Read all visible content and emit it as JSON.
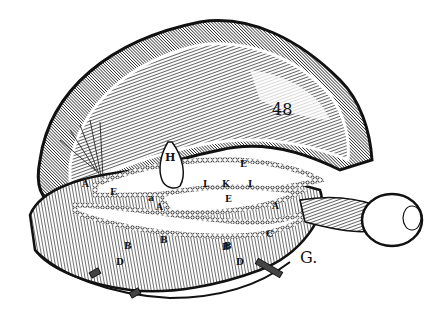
{
  "illustration": {
    "subject": "Anatomical woodcut of brain dissection with eye and optic nerve",
    "colors": {
      "ink": "#111111",
      "paper": "#ffffff"
    },
    "plate_number": "48",
    "figure_letter": "G.",
    "labels": {
      "H": "H",
      "E_left": "E",
      "E_center": "E",
      "E_right": "E",
      "L": "L",
      "K": "K",
      "I": "I",
      "A_left": "A",
      "A_center": "A",
      "A_right": "A",
      "B1": "B",
      "B2": "B",
      "B3": "B",
      "B4": "B",
      "D1": "D",
      "D2": "D",
      "C": "C",
      "a": "a"
    }
  }
}
